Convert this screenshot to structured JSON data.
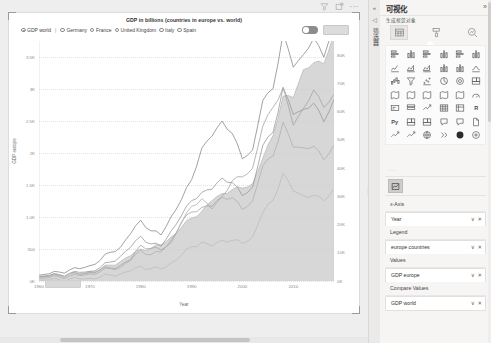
{
  "chart_card": {
    "title": "GDP in billions (countries in europe vs. world)",
    "header_icons": [
      "filter-icon",
      "focus-mode-icon",
      "more-options-icon"
    ],
    "more_dots": "···",
    "legend": [
      {
        "label": "GDP world",
        "selected": true
      },
      {
        "label": "Germany",
        "selected": false
      },
      {
        "label": "France",
        "selected": false
      },
      {
        "label": "United Kingdom",
        "selected": false
      },
      {
        "label": "Italy",
        "selected": false
      },
      {
        "label": "Spain",
        "selected": false
      }
    ],
    "legend_separator": "|",
    "toggle_on": true,
    "mini_button_label": ""
  },
  "chart_data": {
    "type": "line",
    "title": "GDP in billions (countries in europe vs. world)",
    "xlabel": "Year",
    "ylabel": "GDP europe",
    "y2label": "GDP world",
    "xlim": [
      1960,
      2018
    ],
    "ylim": [
      0,
      3750
    ],
    "y2lim": [
      0,
      85000
    ],
    "grid": true,
    "legend_position": "top-left",
    "xticks": [
      "1960",
      "1970",
      "1980",
      "1990",
      "2000",
      "2010"
    ],
    "xtick_values": [
      1960,
      1970,
      1980,
      1990,
      2000,
      2010
    ],
    "yticks": [
      "0K",
      "500",
      "1.0K",
      "1.5K",
      "2K",
      "2.5K",
      "3K",
      "3.5K"
    ],
    "ytick_values": [
      0,
      500,
      1000,
      1500,
      2000,
      2500,
      3000,
      3500
    ],
    "y2ticks": [
      "0K",
      "10K",
      "20K",
      "30K",
      "40K",
      "50K",
      "60K",
      "70K",
      "80K"
    ],
    "y2tick_values": [
      0,
      10000,
      20000,
      30000,
      40000,
      50000,
      60000,
      70000,
      80000
    ],
    "x": [
      1960,
      1962,
      1964,
      1966,
      1968,
      1970,
      1972,
      1974,
      1976,
      1978,
      1980,
      1982,
      1984,
      1986,
      1988,
      1990,
      1992,
      1994,
      1996,
      1998,
      2000,
      2002,
      2004,
      2006,
      2008,
      2010,
      2012,
      2014,
      2016,
      2018
    ],
    "series": [
      {
        "name": "GDP world",
        "axis": "y2",
        "style": "area",
        "color": "#c9c9c9",
        "values": [
          1400,
          1600,
          1900,
          2200,
          2600,
          3300,
          4100,
          5500,
          6800,
          9200,
          11300,
          11800,
          12400,
          15500,
          18900,
          22600,
          25300,
          27800,
          31000,
          31600,
          33600,
          35000,
          43400,
          51400,
          63400,
          66100,
          74900,
          79300,
          76300,
          85900
        ]
      },
      {
        "name": "Germany",
        "axis": "y",
        "style": "line",
        "color": "#8a8a8a",
        "values": [
          90,
          110,
          140,
          170,
          200,
          240,
          320,
          440,
          520,
          760,
          950,
          800,
          700,
          1000,
          1270,
          1600,
          2130,
          2210,
          2500,
          2250,
          1950,
          2080,
          2820,
          3000,
          3750,
          3400,
          3540,
          3890,
          3470,
          3960
        ]
      },
      {
        "name": "France",
        "axis": "y",
        "style": "line",
        "color": "#9a9a9a",
        "values": [
          62,
          78,
          95,
          115,
          140,
          150,
          210,
          290,
          380,
          540,
          700,
          590,
          530,
          780,
          1020,
          1270,
          1420,
          1400,
          1610,
          1500,
          1360,
          1490,
          2120,
          2320,
          2930,
          2650,
          2680,
          2850,
          2470,
          2780
        ]
      },
      {
        "name": "United Kingdom",
        "axis": "y",
        "style": "line",
        "color": "#a5a5a5",
        "values": [
          73,
          85,
          100,
          115,
          110,
          130,
          170,
          200,
          240,
          340,
          560,
          520,
          470,
          600,
          920,
          1090,
          1180,
          1140,
          1320,
          1530,
          1660,
          1790,
          2420,
          2710,
          2920,
          2480,
          2700,
          3060,
          2690,
          2860
        ]
      },
      {
        "name": "Italy",
        "axis": "y",
        "style": "line",
        "color": "#b0b0b0",
        "values": [
          40,
          52,
          64,
          74,
          88,
          110,
          140,
          190,
          210,
          330,
          480,
          420,
          440,
          640,
          900,
          1180,
          1320,
          1100,
          1310,
          1270,
          1140,
          1270,
          1800,
          1950,
          2400,
          2130,
          2080,
          2160,
          1880,
          2080
        ]
      },
      {
        "name": "Spain",
        "axis": "y",
        "style": "line",
        "color": "#bdbdbd",
        "values": [
          12,
          16,
          22,
          28,
          34,
          41,
          60,
          90,
          110,
          160,
          230,
          200,
          180,
          280,
          400,
          540,
          620,
          530,
          640,
          620,
          600,
          700,
          1070,
          1260,
          1630,
          1430,
          1330,
          1370,
          1240,
          1420
        ]
      }
    ]
  },
  "right_panel": {
    "rail": {
      "collapse_icon": "«",
      "back_icon": "◁",
      "vertical_label": "筛选器"
    },
    "title": "可视化",
    "expand_icon": "»",
    "subtitle": "生成视觉对象",
    "tabs": [
      {
        "name": "build-visual-tab",
        "icon": "table-icon",
        "selected": true
      },
      {
        "name": "format-visual-tab",
        "icon": "paint-roller-icon",
        "selected": false
      },
      {
        "name": "analytics-tab",
        "icon": "magnifier-chart-icon",
        "selected": false
      }
    ],
    "gallery_dots": "···",
    "gallery": [
      "stacked-bar-chart-icon",
      "stacked-column-chart-icon",
      "clustered-bar-chart-icon",
      "clustered-column-chart-icon",
      "100-stacked-bar-chart-icon",
      "100-stacked-column-chart-icon",
      "line-chart-icon",
      "area-chart-icon",
      "stacked-area-chart-icon",
      "line-stacked-column-icon",
      "line-clustered-column-icon",
      "ribbon-chart-icon",
      "waterfall-chart-icon",
      "funnel-chart-icon",
      "scatter-chart-icon",
      "pie-chart-icon",
      "donut-chart-icon",
      "treemap-icon",
      "map-icon",
      "filled-map-icon",
      "shape-map-icon",
      "azure-map-icon",
      "arcgis-map-icon",
      "gauge-icon",
      "card-icon",
      "multi-row-card-icon",
      "kpi-icon",
      "table-icon",
      "matrix-icon",
      "r-script-visual-icon",
      "python-visual-icon",
      "key-influencers-icon",
      "decomposition-tree-icon",
      "q-and-a-icon",
      "smart-narrative-icon",
      "paginated-report-icon",
      "metrics-icon",
      "performance-icon",
      "globe-icon",
      "chevrons-icon",
      "dark-sphere-icon",
      "get-more-visuals-icon"
    ],
    "format_icon": "format-visual-icon",
    "wells": [
      {
        "label": "x-Axis",
        "field": "Year",
        "has_field": true
      },
      {
        "label": "Legend",
        "field": "europe countries",
        "has_field": true
      },
      {
        "label": "Values",
        "field": "GDP europe",
        "has_field": true
      },
      {
        "label": "Compare Values",
        "field": "GDP world",
        "has_field": true
      }
    ],
    "field_actions": {
      "dropdown": "∨",
      "remove": "✕"
    }
  }
}
